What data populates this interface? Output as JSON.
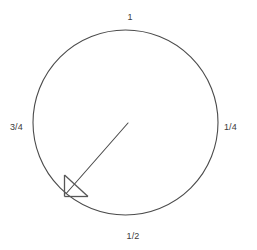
{
  "figure": {
    "background_color": "#ffffff",
    "stroke_color": "#4b4b4b",
    "text_color": "#3b3b3b",
    "width": 257,
    "height": 250
  },
  "chart_data": {
    "type": "scatter",
    "title": "",
    "subtitle": "",
    "xlabel": "",
    "ylabel": "",
    "grid": false,
    "legend": null,
    "coordinate_system": "polar-fraction",
    "circle": {
      "center_x": 125.5,
      "center_y": 122.5,
      "radius": 92.5,
      "stroke_width": 1,
      "fill": "none"
    },
    "tick_labels": [
      {
        "label": "1",
        "fraction": 1.0,
        "position": "top"
      },
      {
        "label": "1/4",
        "fraction": 0.25,
        "position": "right"
      },
      {
        "label": "1/2",
        "fraction": 0.5,
        "position": "bottom"
      },
      {
        "label": "3/4",
        "fraction": 0.75,
        "position": "left"
      }
    ],
    "pointer": {
      "name": "radius-arrow",
      "fraction": 0.62,
      "from_x": 128,
      "from_y": 123,
      "to_x": 64,
      "to_y": 196,
      "arrowhead": "open-triangle",
      "stroke_width": 1
    }
  },
  "labels": {
    "top": "1",
    "right": "1/4",
    "bottom": "1/2",
    "left": "3/4"
  }
}
